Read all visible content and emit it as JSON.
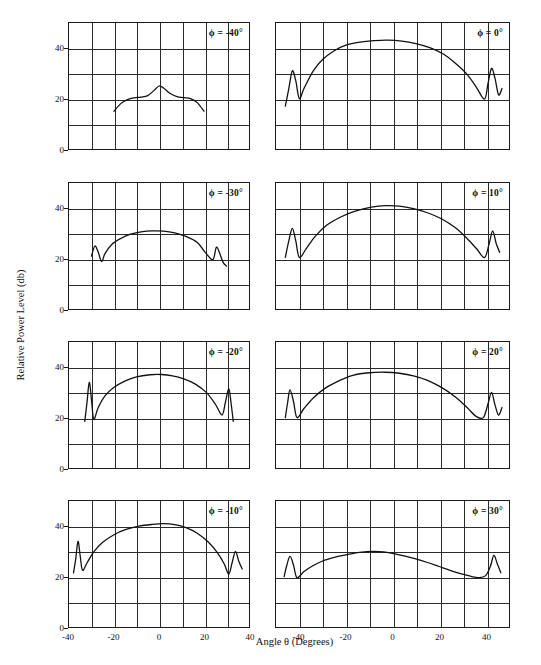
{
  "figure": {
    "xlabel": "Angle θ (Degrees)",
    "ylabel": "Relative Power Level (db)"
  },
  "chart_data": {
    "type": "line",
    "title": "",
    "xlabel": "Angle θ (Degrees)",
    "ylabel": "Relative Power Level (db)",
    "ylim": [
      0,
      50
    ],
    "yticks": [
      0,
      20,
      40
    ],
    "ygridlines": [
      0,
      10,
      20,
      30,
      40,
      50
    ],
    "grid": true,
    "legend_position": "panel-top-right",
    "panels": [
      {
        "label": "ϕ = -40°",
        "row": 0,
        "col": 0,
        "xlim": [
          -40,
          40
        ],
        "xticks": [
          -40,
          -20,
          0,
          20,
          40
        ],
        "peak_db": 25,
        "peak_angle": 0,
        "x": [
          -20,
          -17,
          -14,
          -11,
          -8,
          -5,
          -2,
          0,
          2,
          5,
          8,
          11,
          14,
          17,
          20
        ],
        "y": [
          15,
          18,
          19.6,
          20.3,
          20.6,
          21.2,
          23.4,
          25,
          24.2,
          22,
          20.8,
          20.4,
          20,
          18.4,
          15
        ]
      },
      {
        "label": "ϕ = 0°",
        "row": 0,
        "col": 1,
        "xlim": [
          -50,
          50
        ],
        "xticks": [
          -40,
          -20,
          0,
          20,
          40
        ],
        "peak_db": 43,
        "peak_angle": -2,
        "x": [
          -46,
          -44.5,
          -43,
          -41.5,
          -40,
          -38,
          -34,
          -30,
          -25,
          -20,
          -14,
          -8,
          -2,
          4,
          10,
          16,
          22,
          27,
          32,
          36,
          39.5,
          41,
          42.5,
          44,
          45.5,
          47
        ],
        "y": [
          17,
          24,
          31,
          27,
          20,
          24,
          31,
          35.5,
          39,
          41.2,
          42.4,
          43,
          43.2,
          42.8,
          41.8,
          40.2,
          37.6,
          34,
          29.6,
          24.5,
          19.8,
          26,
          32,
          28,
          21.5,
          24
        ]
      },
      {
        "label": "ϕ = -30°",
        "row": 1,
        "col": 0,
        "xlim": [
          -40,
          40
        ],
        "xticks": [
          -40,
          -20,
          0,
          20,
          40
        ],
        "peak_db": 31,
        "peak_angle": 0,
        "x": [
          -30,
          -28.5,
          -27,
          -25.5,
          -24,
          -21,
          -17,
          -13,
          -8,
          -3,
          2,
          7,
          12,
          17,
          21,
          24,
          25.5,
          27,
          28.5,
          30
        ],
        "y": [
          21,
          25,
          22.5,
          18.8,
          22,
          25.6,
          28,
          29.6,
          30.6,
          31,
          30.9,
          30.2,
          28.8,
          26.4,
          22,
          19.6,
          24.5,
          22,
          18.5,
          17
        ]
      },
      {
        "label": "ϕ = 10°",
        "row": 1,
        "col": 1,
        "xlim": [
          -50,
          50
        ],
        "xticks": [
          -40,
          -20,
          0,
          20,
          40
        ],
        "peak_db": 41,
        "peak_angle": -2,
        "x": [
          -46,
          -44.5,
          -43,
          -41.5,
          -40,
          -37,
          -33,
          -28,
          -22,
          -16,
          -9,
          -3,
          3,
          9,
          15,
          21,
          27,
          32,
          36,
          39.5,
          41.5,
          43,
          44.5,
          46
        ],
        "y": [
          20.5,
          27,
          32,
          27,
          20.5,
          24,
          29,
          33.4,
          36.6,
          38.8,
          40.4,
          41,
          40.8,
          39.8,
          38.2,
          35.8,
          32.2,
          28,
          24,
          20.4,
          26,
          31,
          26,
          22.5
        ]
      },
      {
        "label": "ϕ = -20°",
        "row": 2,
        "col": 0,
        "xlim": [
          -40,
          40
        ],
        "xticks": [
          -40,
          -20,
          0,
          20,
          40
        ],
        "peak_db": 37,
        "peak_angle": 0,
        "x": [
          -33,
          -32,
          -31,
          -30,
          -29,
          -27,
          -24,
          -20,
          -15,
          -10,
          -4,
          1,
          6,
          11,
          16,
          21,
          25,
          28,
          29.5,
          31,
          32,
          33
        ],
        "y": [
          18.5,
          26,
          34,
          27,
          19.4,
          24,
          28.6,
          32,
          34.6,
          36.2,
          37,
          37.1,
          36.6,
          35.4,
          33.4,
          30,
          25.4,
          21,
          26,
          31.5,
          26,
          18.5
        ]
      },
      {
        "label": "ϕ = 20°",
        "row": 2,
        "col": 1,
        "xlim": [
          -50,
          50
        ],
        "xticks": [
          -40,
          -20,
          0,
          20,
          40
        ],
        "peak_db": 38,
        "peak_angle": -3,
        "x": [
          -46,
          -45,
          -44,
          -42.5,
          -41,
          -38,
          -34,
          -29,
          -23,
          -17,
          -10,
          -3,
          3,
          9,
          15,
          21,
          27,
          32,
          36,
          39,
          41,
          42.5,
          44,
          45.5,
          47
        ],
        "y": [
          20,
          26,
          31,
          26.5,
          20,
          23.6,
          27.8,
          31.6,
          34.6,
          36.8,
          37.8,
          38,
          37.6,
          36.6,
          34.8,
          32,
          28.2,
          24,
          20.4,
          20,
          25.5,
          30,
          25,
          21,
          24
        ]
      },
      {
        "label": "ϕ = -10°",
        "row": 3,
        "col": 0,
        "xlim": [
          -40,
          40
        ],
        "xticks": [
          -40,
          -20,
          0,
          20,
          40
        ],
        "peak_db": 41,
        "peak_angle": 2,
        "x": [
          -38,
          -37,
          -36,
          -35,
          -34,
          -32,
          -29,
          -25,
          -20,
          -15,
          -9,
          -3,
          2,
          7,
          12,
          17,
          22,
          26,
          29,
          31,
          32.5,
          34,
          35.5,
          37
        ],
        "y": [
          21.5,
          27,
          34,
          28,
          22.5,
          25.4,
          29.8,
          33.6,
          36.6,
          38.6,
          40,
          40.7,
          41,
          40.6,
          39.4,
          37.2,
          33.6,
          29.4,
          25,
          21,
          25.5,
          30,
          26,
          23
        ]
      },
      {
        "label": "ϕ = 30°",
        "row": 3,
        "col": 1,
        "xlim": [
          -50,
          50
        ],
        "xticks": [
          -40,
          -20,
          0,
          20,
          40
        ],
        "peak_db": 30,
        "peak_angle": -8,
        "x": [
          -46.5,
          -45.5,
          -44,
          -42.5,
          -41,
          -38,
          -34,
          -30,
          -25,
          -20,
          -15,
          -11,
          -8,
          -4,
          0,
          5,
          10,
          15,
          20,
          25,
          30,
          34,
          37,
          40,
          42,
          43.5,
          45,
          46.5
        ],
        "y": [
          20,
          24,
          28,
          24.6,
          19.6,
          22,
          24.4,
          26.2,
          27.6,
          28.6,
          29.5,
          29.9,
          30,
          29.8,
          29.2,
          28.2,
          27,
          25.6,
          24,
          22.4,
          21,
          20,
          19.6,
          20.4,
          24,
          28.4,
          25,
          21.5
        ]
      }
    ]
  }
}
